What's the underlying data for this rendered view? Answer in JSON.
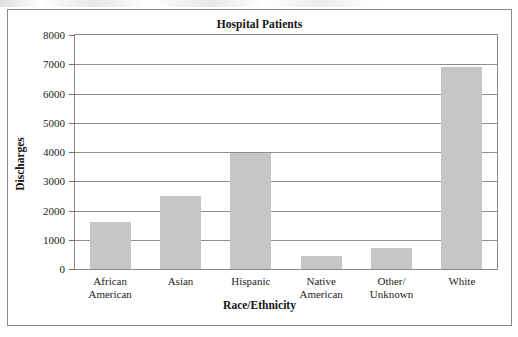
{
  "chart_data": {
    "type": "bar",
    "title": "Hospital Patients",
    "xlabel": "Race/Ethnicity",
    "ylabel": "Discharges",
    "categories": [
      "African\nAmerican",
      "Asian",
      "Hispanic",
      "Native\nAmerican",
      "Other/\nUnknown",
      "White"
    ],
    "values": [
      1620,
      2480,
      3950,
      450,
      710,
      6900
    ],
    "ylim": [
      0,
      8000
    ],
    "yticks": [
      0,
      1000,
      2000,
      3000,
      4000,
      5000,
      6000,
      7000,
      8000
    ],
    "ytick_labels": [
      "0",
      "1000",
      "2000",
      "3000",
      "4000",
      "5000",
      "6000",
      "7000",
      "8000"
    ],
    "grid": true,
    "legend": false,
    "bar_color": "#c6c6c6",
    "gridline_color": "#8c8c8c",
    "text_color": "#232323"
  }
}
